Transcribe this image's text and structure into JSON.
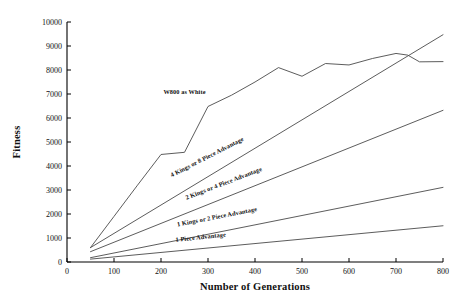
{
  "chart_data": {
    "type": "line",
    "title": "",
    "xlabel": "Number of Generations",
    "ylabel": "Fitness",
    "xlim": [
      0,
      800
    ],
    "ylim": [
      0,
      10000
    ],
    "xticks": [
      0,
      100,
      200,
      300,
      400,
      500,
      600,
      700,
      800
    ],
    "yticks": [
      0,
      1000,
      2000,
      3000,
      4000,
      5000,
      6000,
      7000,
      8000,
      9000,
      10000
    ],
    "xtick_labels": [
      "0",
      "100",
      "200",
      "300",
      "400",
      "500",
      "600",
      "700",
      "800"
    ],
    "ytick_labels": [
      "0",
      "1000",
      "2000",
      "3000",
      "4000",
      "5000",
      "6000",
      "7000",
      "8000",
      "9000",
      "10000"
    ],
    "grid": false,
    "legend_position": "inline-labels",
    "line_color": "#4a4a4a",
    "axis_color": "#000000",
    "series": [
      {
        "name": "W800 as White",
        "label": "W800 as White",
        "label_x": 250,
        "label_y": 7000,
        "label_rotation": 0,
        "x": [
          50,
          100,
          150,
          200,
          250,
          300,
          350,
          400,
          450,
          500,
          550,
          600,
          650,
          700,
          725,
          750,
          800
        ],
        "values": [
          600,
          1900,
          3200,
          4480,
          4570,
          6480,
          6950,
          7500,
          8100,
          7740,
          8270,
          8210,
          8480,
          8690,
          8620,
          8340,
          8350
        ]
      },
      {
        "name": "4 Kings or 8 Piece Advantage",
        "label": "4 Kings or 8 Piece Advantage",
        "label_x": 300,
        "label_y": 4300,
        "label_rotation": -27,
        "x": [
          50,
          800
        ],
        "values": [
          600,
          9470
        ]
      },
      {
        "name": "2 Kings or 4 Piece Advantage",
        "label": "2 Kings or 4 Piece Advantage",
        "label_x": 335,
        "label_y": 3200,
        "label_rotation": -21,
        "x": [
          50,
          800
        ],
        "values": [
          430,
          6320
        ]
      },
      {
        "name": "1 Kings or 2 Piece Advantage",
        "label": "1 Kings or 2 Piece Advantage",
        "label_x": 320,
        "label_y": 1800,
        "label_rotation": -11,
        "x": [
          50,
          800
        ],
        "values": [
          180,
          3110
        ]
      },
      {
        "name": "1 Piece Advantage",
        "label": "1 Piece Advantage",
        "label_x": 285,
        "label_y": 950,
        "label_rotation": -6,
        "x": [
          50,
          800
        ],
        "values": [
          120,
          1510
        ]
      }
    ]
  }
}
